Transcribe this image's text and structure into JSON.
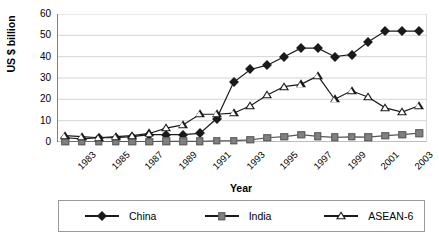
{
  "chart_data": {
    "type": "line",
    "title": "",
    "xlabel": "Year",
    "ylabel": "US $ billion",
    "xlim": [
      1983,
      2004
    ],
    "ylim": [
      0,
      60
    ],
    "ytick_values": [
      0,
      10,
      20,
      30,
      40,
      50,
      60
    ],
    "ytick_labels": [
      "0",
      "10",
      "20",
      "30",
      "40",
      "50",
      "60"
    ],
    "xtick_labels": [
      "1983",
      "1985",
      "1987",
      "1989",
      "1991",
      "1993",
      "1995",
      "1997",
      "1999",
      "2001",
      "2003"
    ],
    "x": [
      1983,
      1984,
      1985,
      1986,
      1987,
      1988,
      1989,
      1990,
      1991,
      1992,
      1993,
      1994,
      1995,
      1996,
      1997,
      1998,
      1999,
      2000,
      2001,
      2002,
      2003,
      2004
    ],
    "grid": true,
    "grid_axis": "y",
    "legend_position": "bottom",
    "series": [
      {
        "name": "China",
        "marker": "filled-diamond",
        "color": "#1a1a1a",
        "values": [
          2,
          1.5,
          2,
          2,
          2.5,
          3.5,
          3.5,
          3.5,
          4,
          11,
          28,
          34,
          36,
          40,
          44,
          44,
          40,
          41,
          47,
          52,
          52,
          52
        ]
      },
      {
        "name": "India",
        "marker": "filled-square",
        "color": "#808080",
        "values": [
          0.1,
          0.1,
          0.1,
          0.2,
          0.2,
          0.2,
          0.3,
          0.3,
          0.3,
          0.5,
          0.6,
          1,
          2,
          2.5,
          3.5,
          2.6,
          2.2,
          2.4,
          2.3,
          3,
          3.5,
          4.2
        ]
      },
      {
        "name": "ASEAN-6",
        "marker": "open-triangle",
        "color": "#1a1a1a",
        "values": [
          3,
          2.5,
          2,
          2.5,
          3,
          4,
          6.5,
          8,
          13,
          13,
          13.5,
          17,
          22,
          26,
          27,
          31,
          20,
          24,
          21,
          16,
          14,
          17
        ]
      }
    ]
  },
  "legend": {
    "entries": [
      {
        "label": "China"
      },
      {
        "label": "India"
      },
      {
        "label": "ASEAN-6"
      }
    ]
  }
}
